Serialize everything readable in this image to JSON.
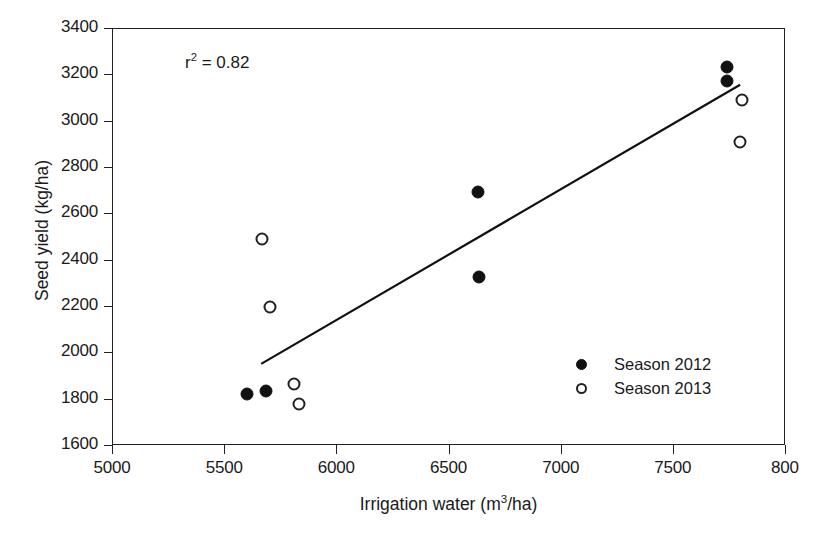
{
  "chart_data": {
    "type": "scatter",
    "title": "",
    "xlabel": "Irrigation water (m3/ha)",
    "ylabel": "Seed yield (kg/ha)",
    "xlim": [
      5000,
      8000
    ],
    "ylim": [
      1600,
      3400
    ],
    "xticks": [
      5000,
      5500,
      6000,
      6500,
      7000,
      7500,
      8000
    ],
    "xtick_labels": [
      "5000",
      "5500",
      "6000",
      "6500",
      "7000",
      "7500",
      "800"
    ],
    "yticks": [
      1600,
      1800,
      2000,
      2200,
      2400,
      2600,
      2800,
      3000,
      3200,
      3400
    ],
    "ytick_labels": [
      "1600",
      "1800",
      "2000",
      "2200",
      "2400",
      "2600",
      "2800",
      "3000",
      "3200",
      "3400"
    ],
    "grid": false,
    "legend_position": "lower-right",
    "annotations": [
      {
        "text": "r2 = 0.82",
        "x": 5330,
        "y": 3250
      }
    ],
    "series": [
      {
        "name": "Season 2012",
        "marker": "filled-circle",
        "color": "#111111",
        "points": [
          {
            "x": 5600,
            "y": 1820
          },
          {
            "x": 5685,
            "y": 1835
          },
          {
            "x": 6630,
            "y": 2690
          },
          {
            "x": 6635,
            "y": 2325
          },
          {
            "x": 7740,
            "y": 3230
          },
          {
            "x": 7740,
            "y": 3170
          }
        ]
      },
      {
        "name": "Season 2013",
        "marker": "open-circle",
        "color": "#222222",
        "points": [
          {
            "x": 5670,
            "y": 2490
          },
          {
            "x": 5705,
            "y": 2195
          },
          {
            "x": 5810,
            "y": 1865
          },
          {
            "x": 5835,
            "y": 1775
          },
          {
            "x": 7810,
            "y": 3090
          },
          {
            "x": 7800,
            "y": 2910
          }
        ]
      }
    ],
    "trendline": {
      "name": "linear-fit",
      "x_start": 5665,
      "y_start": 1950,
      "x_end": 7800,
      "y_end": 3155,
      "color": "#111111"
    }
  },
  "annotation": {
    "r_squared_prefix": "r",
    "r_squared_exp": "2",
    "r_squared_value": " = 0.82"
  },
  "axes": {
    "x_title_main": "Irrigation water (m",
    "x_title_exp": "3",
    "x_title_tail": "/ha)",
    "y_title": "Seed yield (kg/ha)"
  },
  "legend": {
    "entries": [
      {
        "label": "Season 2012",
        "marker": "filled-circle"
      },
      {
        "label": "Season 2013",
        "marker": "open-circle"
      }
    ]
  }
}
